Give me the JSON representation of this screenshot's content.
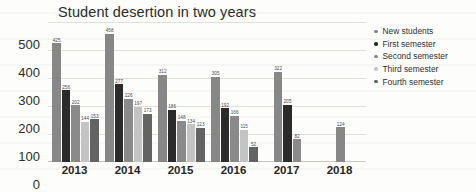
{
  "chart_data": {
    "type": "bar",
    "title": "Student desertion in two years",
    "xlabel": "",
    "ylabel": "",
    "ylim": [
      0,
      500
    ],
    "yticks": [
      0,
      100,
      200,
      300,
      400,
      500
    ],
    "grid": true,
    "legend_position": "right",
    "categories": [
      "2013",
      "2014",
      "2015",
      "2016",
      "2017",
      "2018"
    ],
    "series": [
      {
        "name": "New students",
        "color": "#878787",
        "values": [
          425,
          458,
          312,
          305,
          322,
          124
        ]
      },
      {
        "name": "First semester",
        "color": "#2b2b2b",
        "values": [
          256,
          277,
          186,
          192,
          205,
          null
        ]
      },
      {
        "name": "Second semester",
        "color": "#8a8a8a",
        "values": [
          202,
          226,
          148,
          166,
          82,
          null
        ]
      },
      {
        "name": "Third semester",
        "color": "#c4c4c4",
        "values": [
          144,
          197,
          134,
          115,
          null,
          null
        ]
      },
      {
        "name": "Fourth semester",
        "color": "#636363",
        "values": [
          153,
          173,
          123,
          52,
          null,
          null
        ]
      }
    ]
  }
}
